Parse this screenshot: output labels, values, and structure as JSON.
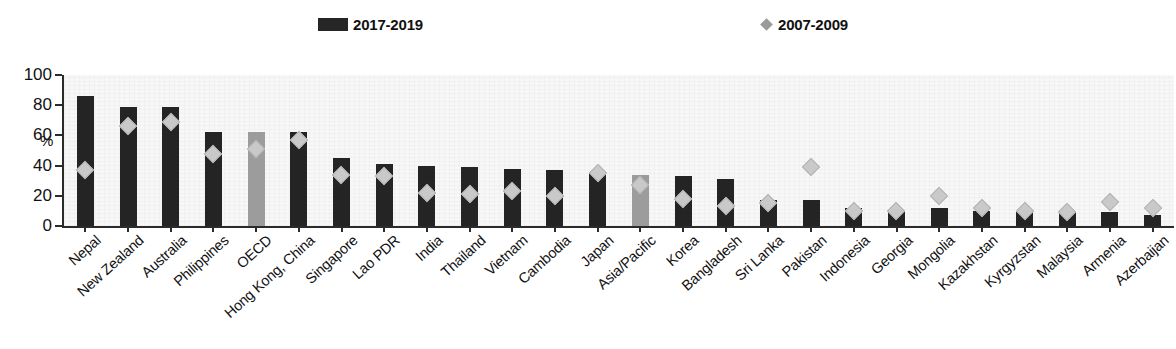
{
  "clipped_title": "",
  "legend": {
    "items": [
      {
        "label": "2017-2019",
        "marker": "bar-swatch",
        "color": "#262626"
      },
      {
        "label": "2007-2009",
        "marker": "diamond-swatch",
        "color": "#9a9a9a"
      }
    ]
  },
  "axes": {
    "y_unit": "%",
    "y_ticks": [
      "100",
      "80",
      "60",
      "40",
      "20",
      "0"
    ]
  },
  "colors": {
    "bar": "#242424",
    "bar_highlight": "#9c9c9c",
    "diamond": "#c9c9c9",
    "axis": "#2b2b2b"
  },
  "chart_data": {
    "type": "bar",
    "title": "",
    "xlabel": "",
    "ylabel": "%",
    "ylim": [
      0,
      100
    ],
    "ytick_step": 20,
    "grid": false,
    "legend_position": "top",
    "categories": [
      "Nepal",
      "New Zealand",
      "Australia",
      "Philippines",
      "OECD",
      "Hong Kong, China",
      "Singapore",
      "Lao PDR",
      "India",
      "Thailand",
      "Vietnam",
      "Cambodia",
      "Japan",
      "Asia/Pacific",
      "Korea",
      "Bangladesh",
      "Sri Lanka",
      "Pakistan",
      "Indonesia",
      "Georgia",
      "Mongolia",
      "Kazakhstan",
      "Kyrgyzstan",
      "Malaysia",
      "Armenia",
      "Azerbaijan"
    ],
    "highlight_categories": [
      "OECD",
      "Asia/Pacific"
    ],
    "series": [
      {
        "name": "2017-2019",
        "type": "bar",
        "values": [
          86,
          79,
          79,
          62,
          62,
          62,
          45,
          41,
          40,
          39,
          38,
          37,
          36,
          34,
          33,
          31,
          17,
          17,
          12,
          10,
          12,
          10,
          9,
          9,
          9,
          7
        ]
      },
      {
        "name": "2007-2009",
        "type": "diamond",
        "values": [
          37,
          66,
          69,
          48,
          51,
          57,
          34,
          33,
          22,
          21,
          23,
          20,
          35,
          27,
          18,
          13,
          15,
          39,
          10,
          10,
          20,
          12,
          10,
          9,
          16,
          12
        ]
      }
    ]
  }
}
